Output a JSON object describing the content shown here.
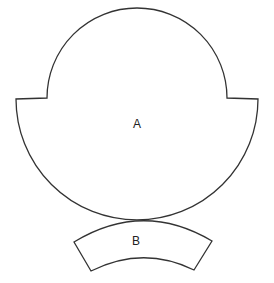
{
  "diagram": {
    "title": "",
    "shapes": [
      {
        "id": "A",
        "label": "A",
        "description": "rounded cap shape with stepped shoulders (upper arc narrower than lower arc)"
      },
      {
        "id": "B",
        "label": "B",
        "description": "curved annular-sector strip below shape A, tangent to its bottom"
      }
    ],
    "colors": {
      "stroke": "#333333",
      "fill": "#ffffff",
      "text": "#222222",
      "background": "#ffffff"
    }
  }
}
